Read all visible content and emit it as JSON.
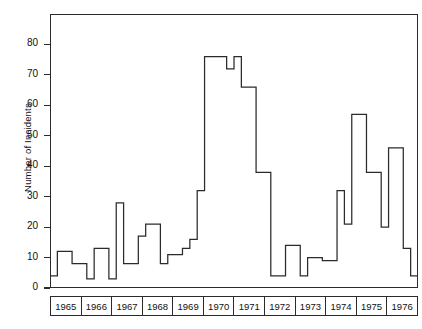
{
  "chart_data": {
    "type": "line",
    "title": "",
    "xlabel": "",
    "ylabel": "Number of Incidents",
    "ylim": [
      0,
      90
    ],
    "yticks": [
      0,
      10,
      20,
      30,
      40,
      50,
      60,
      70,
      80
    ],
    "ytick_labels": [
      "0",
      "10",
      "20",
      "30",
      "40",
      "50",
      "60",
      "70",
      "80"
    ],
    "xlim": [
      1965,
      1977
    ],
    "xtick_labels": [
      "1965",
      "1966",
      "1967",
      "1968",
      "1969",
      "1970",
      "1971",
      "1972",
      "1973",
      "1974",
      "1975",
      "1976"
    ],
    "grid": false,
    "legend": null,
    "drawstyle": "steps-post",
    "bin_width_years": 0.25,
    "x_start": 1965,
    "series": [
      {
        "name": "Number of Incidents",
        "color": "#2b2b2b",
        "values": [
          4,
          12,
          12,
          8,
          8,
          3,
          13,
          13,
          3,
          28,
          8,
          8,
          17,
          21,
          21,
          8,
          11,
          11,
          13,
          16,
          32,
          76,
          76,
          76,
          72,
          76,
          66,
          66,
          38,
          38,
          4,
          4,
          14,
          14,
          4,
          10,
          10,
          9,
          9,
          32,
          21,
          57,
          57,
          38,
          38,
          20,
          46,
          46,
          13,
          4
        ]
      }
    ]
  },
  "axis": {
    "y_label": "Number of Incidents",
    "y_tick_0": "0",
    "y_tick_10": "10",
    "y_tick_20": "20",
    "y_tick_30": "30",
    "y_tick_40": "40",
    "y_tick_50": "50",
    "y_tick_60": "60",
    "y_tick_70": "70",
    "y_tick_80": "80"
  },
  "years": [
    {
      "label": "1965"
    },
    {
      "label": "1966"
    },
    {
      "label": "1967"
    },
    {
      "label": "1968"
    },
    {
      "label": "1969"
    },
    {
      "label": "1970"
    },
    {
      "label": "1971"
    },
    {
      "label": "1972"
    },
    {
      "label": "1973"
    },
    {
      "label": "1974"
    },
    {
      "label": "1975"
    },
    {
      "label": "1976"
    }
  ]
}
